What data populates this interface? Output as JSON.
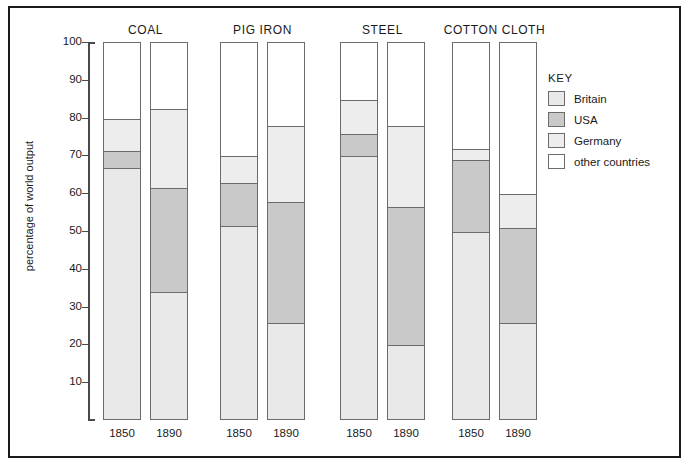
{
  "chart_data": {
    "type": "bar",
    "title": "",
    "subtitle": "",
    "xlabel": "",
    "ylabel": "percentage of world output",
    "ylim": [
      0,
      100
    ],
    "yticks": [
      10,
      20,
      30,
      40,
      50,
      60,
      70,
      80,
      90,
      100
    ],
    "grid": false,
    "stacked": true,
    "legend_position": "right",
    "legend_title": "KEY",
    "categories": [
      "COAL 1850",
      "COAL 1890",
      "PIG IRON 1850",
      "PIG IRON 1890",
      "STEEL 1850",
      "STEEL 1890",
      "COTTON CLOTH 1850",
      "COTTON CLOTH 1890"
    ],
    "series": [
      {
        "name": "Britain",
        "color": "#e9e9e9",
        "values": [
          67,
          34,
          51.5,
          26,
          70,
          20,
          50,
          26
        ]
      },
      {
        "name": "USA",
        "color": "#c9c9c9",
        "values": [
          4.5,
          27.7,
          11.5,
          32,
          6,
          36.5,
          19,
          25
        ]
      },
      {
        "name": "Germany",
        "color": "#ededed",
        "values": [
          8.5,
          20.8,
          7,
          20,
          9,
          21.5,
          3,
          9
        ]
      },
      {
        "name": "other countries",
        "color": "#ffffff",
        "values": [
          20,
          17.5,
          30,
          22,
          15,
          22,
          28,
          40
        ]
      }
    ],
    "cumulative_tops": {
      "COAL 1850": {
        "Britain": 67,
        "USA": 71.5,
        "Germany": 80,
        "other countries": 100
      },
      "COAL 1890": {
        "Britain": 34,
        "USA": 61.7,
        "Germany": 82.5,
        "other countries": 100
      },
      "PIG IRON 1850": {
        "Britain": 51.5,
        "USA": 63,
        "Germany": 70,
        "other countries": 100
      },
      "PIG IRON 1890": {
        "Britain": 26,
        "USA": 58,
        "Germany": 78,
        "other countries": 100
      },
      "STEEL 1850": {
        "Britain": 70,
        "USA": 76,
        "Germany": 85,
        "other countries": 100
      },
      "STEEL 1890": {
        "Britain": 20,
        "USA": 56.5,
        "Germany": 78,
        "other countries": 100
      },
      "COTTON CLOTH 1850": {
        "Britain": 50,
        "USA": 69,
        "Germany": 72,
        "other countries": 100
      },
      "COTTON CLOTH 1890": {
        "Britain": 26,
        "USA": 51,
        "Germany": 60,
        "other countries": 100
      }
    }
  },
  "axis": {
    "y_title": "percentage of world output",
    "ticks": [
      "100",
      "90",
      "80",
      "70",
      "60",
      "50",
      "40",
      "30",
      "20",
      "10"
    ]
  },
  "groups": [
    {
      "title": "COAL",
      "bars": [
        {
          "year": "1850",
          "tops": {
            "Britain": 67,
            "USA": 71.5,
            "Germany": 80
          }
        },
        {
          "year": "1890",
          "tops": {
            "Britain": 34,
            "USA": 61.7,
            "Germany": 82.5
          }
        }
      ]
    },
    {
      "title": "PIG IRON",
      "bars": [
        {
          "year": "1850",
          "tops": {
            "Britain": 51.5,
            "USA": 63,
            "Germany": 70
          }
        },
        {
          "year": "1890",
          "tops": {
            "Britain": 26,
            "USA": 58,
            "Germany": 78
          }
        }
      ]
    },
    {
      "title": "STEEL",
      "bars": [
        {
          "year": "1850",
          "tops": {
            "Britain": 70,
            "USA": 76,
            "Germany": 85
          }
        },
        {
          "year": "1890",
          "tops": {
            "Britain": 20,
            "USA": 56.5,
            "Germany": 78
          }
        }
      ]
    },
    {
      "title": "COTTON CLOTH",
      "bars": [
        {
          "year": "1850",
          "tops": {
            "Britain": 50,
            "USA": 69,
            "Germany": 72
          }
        },
        {
          "year": "1890",
          "tops": {
            "Britain": 26,
            "USA": 51,
            "Germany": 60
          }
        }
      ]
    }
  ],
  "key": {
    "title": "KEY",
    "items": [
      {
        "label": "Britain",
        "color": "#e9e9e9"
      },
      {
        "label": "USA",
        "color": "#c9c9c9"
      },
      {
        "label": "Germany",
        "color": "#ededed"
      },
      {
        "label": "other countries",
        "color": "#ffffff"
      }
    ]
  }
}
